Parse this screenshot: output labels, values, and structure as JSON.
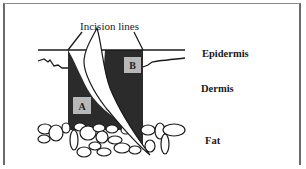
{
  "diagram": {
    "title": "Incision lines",
    "layers": [
      {
        "name": "Epidermis"
      },
      {
        "name": "Dermis"
      },
      {
        "name": "Fat"
      }
    ],
    "regions": [
      {
        "label": "A"
      },
      {
        "label": "B"
      }
    ],
    "colors": {
      "region_fill": "#2b2b2b",
      "label_box": "#b8b8b8",
      "line": "#1a1a1a",
      "frame": "#6a6a6a"
    }
  }
}
